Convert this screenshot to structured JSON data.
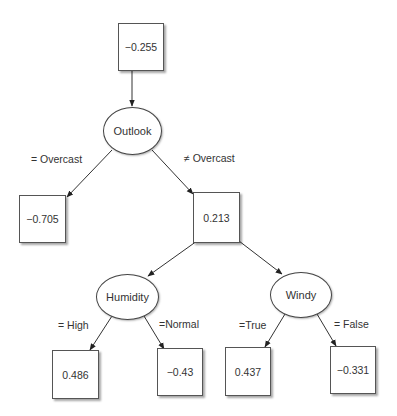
{
  "diagram": {
    "type": "regression-tree",
    "root_value": {
      "label": "−0.255"
    },
    "nodes": {
      "root_box": {
        "label": "−0.255"
      },
      "outlook": {
        "label": "Outlook"
      },
      "overcast_leaf": {
        "label": "−0.705"
      },
      "not_overcast_box": {
        "label": "0.213"
      },
      "humidity": {
        "label": "Humidity"
      },
      "windy": {
        "label": "Windy"
      },
      "high_leaf": {
        "label": "0.486"
      },
      "normal_leaf": {
        "label": "−0.43"
      },
      "true_leaf": {
        "label": "0.437"
      },
      "false_leaf": {
        "label": "−0.331"
      }
    },
    "edges": {
      "eq_overcast": {
        "label": "= Overcast"
      },
      "neq_overcast": {
        "label": "≠ Overcast"
      },
      "eq_high": {
        "label": "= High"
      },
      "eq_normal": {
        "label": "=Normal"
      },
      "eq_true": {
        "label": "=True"
      },
      "eq_false": {
        "label": "= False"
      }
    },
    "colors": {
      "stroke": "#333333",
      "fill": "#ffffff",
      "text": "#333333"
    }
  }
}
